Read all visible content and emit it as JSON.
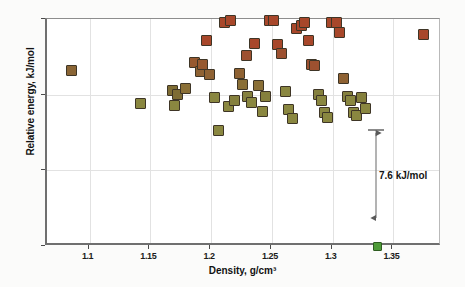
{
  "chart_data": {
    "type": "scatter",
    "title": "",
    "xlabel": "Density, g/cm³",
    "ylabel": "Relative energy, kJ/mol",
    "xlim": [
      1.065,
      1.39
    ],
    "ylim": [
      0,
      15
    ],
    "xticks": [
      1.1,
      1.15,
      1.2,
      1.25,
      1.3,
      1.35
    ],
    "xtick_labels": [
      "1.1",
      "1.15",
      "1.2",
      "1.25",
      "1.3",
      "1.35"
    ],
    "yticks": [
      0,
      5,
      10,
      15
    ],
    "ytick_labels": [
      "0",
      "5",
      "10",
      "15"
    ],
    "grid": "both-light",
    "legend": "none",
    "marker_shape": "square",
    "color_note": "marker fill is a continuous energy-ranked ramp: olive at low energy, brown at mid, brick-red at high energy; the single global-minimum structure is bright green",
    "colors": {
      "low_energy_olive": "#8a8740",
      "mid_energy_brown": "#8a6535",
      "high_energy_red": "#a8472a",
      "global_minimum_green": "#4e9b38",
      "axis": "#6f6f6f",
      "grid": "#e2e2e2",
      "text": "#121212"
    },
    "annotations": [
      {
        "text": "7.6 kJ/mol",
        "type": "double-headed-vertical-arrow",
        "x": 1.337,
        "y_from": 0.0,
        "y_to": 7.6
      }
    ],
    "points": [
      {
        "x": 1.085,
        "y": 11.6,
        "c": "#8a6535"
      },
      {
        "x": 1.142,
        "y": 9.4,
        "c": "#8a8740"
      },
      {
        "x": 1.168,
        "y": 10.3,
        "c": "#7e6c33"
      },
      {
        "x": 1.172,
        "y": 10.0,
        "c": "#7e6c33"
      },
      {
        "x": 1.17,
        "y": 9.3,
        "c": "#8a8740"
      },
      {
        "x": 1.179,
        "y": 10.4,
        "c": "#8a6f36"
      },
      {
        "x": 1.186,
        "y": 12.1,
        "c": "#97592f"
      },
      {
        "x": 1.191,
        "y": 11.5,
        "c": "#8f6233"
      },
      {
        "x": 1.193,
        "y": 12.0,
        "c": "#97592f"
      },
      {
        "x": 1.196,
        "y": 13.6,
        "c": "#a8472a"
      },
      {
        "x": 1.199,
        "y": 11.3,
        "c": "#8f6233"
      },
      {
        "x": 1.203,
        "y": 9.8,
        "c": "#8a8740"
      },
      {
        "x": 1.206,
        "y": 7.6,
        "c": "#8a8740"
      },
      {
        "x": 1.211,
        "y": 14.8,
        "c": "#a8472a"
      },
      {
        "x": 1.216,
        "y": 14.9,
        "c": "#a8472a"
      },
      {
        "x": 1.214,
        "y": 9.2,
        "c": "#8a8740"
      },
      {
        "x": 1.219,
        "y": 9.6,
        "c": "#85803d"
      },
      {
        "x": 1.223,
        "y": 11.4,
        "c": "#8f6233"
      },
      {
        "x": 1.226,
        "y": 10.7,
        "c": "#8a6f36"
      },
      {
        "x": 1.229,
        "y": 12.6,
        "c": "#9d5130"
      },
      {
        "x": 1.23,
        "y": 9.9,
        "c": "#85803d"
      },
      {
        "x": 1.233,
        "y": 9.5,
        "c": "#8a8740"
      },
      {
        "x": 1.236,
        "y": 13.4,
        "c": "#a8472a"
      },
      {
        "x": 1.239,
        "y": 10.6,
        "c": "#8a6f36"
      },
      {
        "x": 1.242,
        "y": 8.9,
        "c": "#8a8740"
      },
      {
        "x": 1.245,
        "y": 9.9,
        "c": "#85803d"
      },
      {
        "x": 1.248,
        "y": 14.9,
        "c": "#a8472a"
      },
      {
        "x": 1.251,
        "y": 14.9,
        "c": "#a8472a"
      },
      {
        "x": 1.255,
        "y": 13.3,
        "c": "#a8472a"
      },
      {
        "x": 1.258,
        "y": 12.7,
        "c": "#9d5130"
      },
      {
        "x": 1.261,
        "y": 10.2,
        "c": "#8a8740"
      },
      {
        "x": 1.264,
        "y": 9.0,
        "c": "#8a8740"
      },
      {
        "x": 1.267,
        "y": 8.4,
        "c": "#8a8740"
      },
      {
        "x": 1.27,
        "y": 14.4,
        "c": "#a8472a"
      },
      {
        "x": 1.274,
        "y": 14.6,
        "c": "#a8472a"
      },
      {
        "x": 1.277,
        "y": 14.8,
        "c": "#a8472a"
      },
      {
        "x": 1.28,
        "y": 13.6,
        "c": "#a8472a"
      },
      {
        "x": 1.283,
        "y": 12.0,
        "c": "#9d5130"
      },
      {
        "x": 1.285,
        "y": 11.9,
        "c": "#9d5130"
      },
      {
        "x": 1.288,
        "y": 10.0,
        "c": "#85803d"
      },
      {
        "x": 1.291,
        "y": 9.6,
        "c": "#8a8740"
      },
      {
        "x": 1.293,
        "y": 8.8,
        "c": "#8a8740"
      },
      {
        "x": 1.296,
        "y": 8.5,
        "c": "#8a8740"
      },
      {
        "x": 1.299,
        "y": 14.8,
        "c": "#a8472a"
      },
      {
        "x": 1.303,
        "y": 14.8,
        "c": "#a8472a"
      },
      {
        "x": 1.306,
        "y": 14.1,
        "c": "#a8472a"
      },
      {
        "x": 1.309,
        "y": 11.1,
        "c": "#8f6233"
      },
      {
        "x": 1.312,
        "y": 9.9,
        "c": "#85803d"
      },
      {
        "x": 1.315,
        "y": 9.6,
        "c": "#8a8740"
      },
      {
        "x": 1.317,
        "y": 8.8,
        "c": "#8a8740"
      },
      {
        "x": 1.32,
        "y": 8.6,
        "c": "#8a8740"
      },
      {
        "x": 1.324,
        "y": 9.8,
        "c": "#85803d"
      },
      {
        "x": 1.327,
        "y": 9.1,
        "c": "#8a8740"
      },
      {
        "x": 1.337,
        "y": 0.0,
        "c": "#4e9b38"
      },
      {
        "x": 1.375,
        "y": 14.0,
        "c": "#a8472a"
      }
    ]
  }
}
